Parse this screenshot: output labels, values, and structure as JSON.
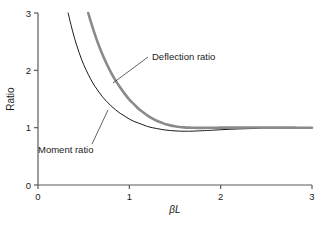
{
  "chart_data": {
    "type": "line",
    "title": "",
    "subtitle": "",
    "xlabel": "βL",
    "ylabel": "Ratio",
    "xlim": [
      0,
      3
    ],
    "ylim": [
      0,
      3
    ],
    "xticks": [
      0,
      1,
      2,
      3
    ],
    "yticks": [
      0,
      1,
      2,
      3
    ],
    "xtick_labels": [
      "0",
      "1",
      "2",
      "3"
    ],
    "ytick_labels": [
      "0",
      "1",
      "2",
      "3"
    ],
    "grid": false,
    "legend_position": "inline-annotations",
    "series": [
      {
        "name": "Moment ratio",
        "color": "#1a1a1a",
        "line_width": 1.0,
        "x": [
          0.33,
          0.36,
          0.4,
          0.45,
          0.5,
          0.55,
          0.6,
          0.65,
          0.7,
          0.75,
          0.8,
          0.85,
          0.9,
          0.95,
          1.0,
          1.05,
          1.1,
          1.15,
          1.2,
          1.25,
          1.3,
          1.35,
          1.4,
          1.45,
          1.5,
          1.55,
          1.6,
          1.65,
          1.7,
          1.75,
          1.8,
          1.9,
          2.0,
          2.1,
          2.2,
          2.3,
          2.4,
          2.5,
          2.6,
          2.7,
          2.8,
          2.9,
          3.0
        ],
        "y": [
          3.0,
          2.8,
          2.56,
          2.31,
          2.1,
          1.93,
          1.78,
          1.66,
          1.55,
          1.46,
          1.38,
          1.31,
          1.25,
          1.2,
          1.15,
          1.11,
          1.08,
          1.05,
          1.02,
          1.0,
          0.985,
          0.97,
          0.958,
          0.95,
          0.944,
          0.94,
          0.938,
          0.938,
          0.94,
          0.943,
          0.947,
          0.955,
          0.964,
          0.972,
          0.978,
          0.983,
          0.987,
          0.99,
          0.992,
          0.994,
          0.995,
          0.996,
          0.997
        ]
      },
      {
        "name": "Deflection ratio",
        "color": "#8a8a8a",
        "line_width": 2.6,
        "x": [
          0.55,
          0.58,
          0.62,
          0.66,
          0.7,
          0.75,
          0.8,
          0.85,
          0.9,
          0.95,
          1.0,
          1.05,
          1.1,
          1.15,
          1.2,
          1.25,
          1.3,
          1.35,
          1.4,
          1.45,
          1.5,
          1.55,
          1.6,
          1.65,
          1.7,
          1.75,
          1.8,
          1.9,
          2.0,
          2.1,
          2.2,
          2.3,
          2.4,
          2.5,
          2.6,
          2.7,
          2.8,
          2.9,
          3.0
        ],
        "y": [
          3.0,
          2.84,
          2.64,
          2.46,
          2.3,
          2.12,
          1.96,
          1.82,
          1.7,
          1.59,
          1.49,
          1.41,
          1.33,
          1.27,
          1.21,
          1.16,
          1.12,
          1.09,
          1.06,
          1.04,
          1.025,
          1.013,
          1.005,
          1.0,
          0.998,
          0.997,
          0.997,
          0.998,
          1.0,
          1.001,
          1.002,
          1.002,
          1.002,
          1.001,
          1.001,
          1.0,
          1.0,
          0.999,
          0.999
        ]
      }
    ],
    "annotations": [
      {
        "text": "Deflection ratio",
        "text_x": 152,
        "text_y": 60,
        "leader_from_x": 148,
        "leader_from_y": 57,
        "leader_to_x": 113,
        "leader_to_y": 83
      },
      {
        "text": "Moment ratio",
        "text_x": 38,
        "text_y": 153,
        "leader_from_x": 92,
        "leader_from_y": 144,
        "leader_to_x": 108,
        "leader_to_y": 110
      }
    ]
  },
  "axes": {
    "y_axis_title": "Ratio",
    "x_axis_title_beta": "β",
    "x_axis_title_l": "L"
  }
}
